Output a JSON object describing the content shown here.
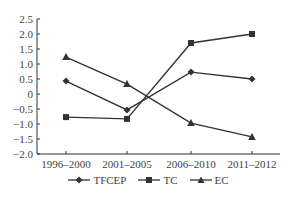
{
  "chart_data": {
    "type": "line",
    "title": "",
    "xlabel": "",
    "ylabel": "",
    "categories": [
      "1996–2000",
      "2001–2005",
      "2006–2010",
      "2011–2012"
    ],
    "series": [
      {
        "name": "TFCEP",
        "marker": "diamond",
        "values": [
          0.43,
          -0.53,
          0.73,
          0.5
        ]
      },
      {
        "name": "TC",
        "marker": "square",
        "values": [
          -0.77,
          -0.83,
          1.7,
          2.0
        ]
      },
      {
        "name": "EC",
        "marker": "triangle",
        "values": [
          1.23,
          0.33,
          -0.97,
          -1.43
        ]
      }
    ],
    "ylim": [
      -2.0,
      2.5
    ],
    "yticks": [
      "2.5",
      "2.0",
      "1.5",
      "1.0",
      "0.5",
      "0",
      "−0.5",
      "−1.0",
      "−1.5",
      "−2.0"
    ],
    "grid": false,
    "legend_position": "bottom",
    "line_color": "#333333"
  },
  "legend": {
    "items": [
      {
        "label": "TFCEP"
      },
      {
        "label": "TC"
      },
      {
        "label": "EC"
      }
    ]
  }
}
